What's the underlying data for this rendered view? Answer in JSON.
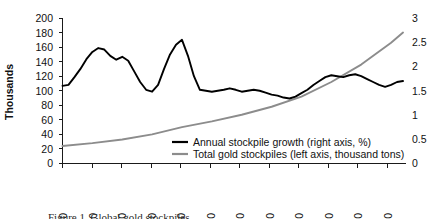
{
  "chart_data": {
    "type": "line",
    "title": "",
    "xlabel": "",
    "ylabel": "Thousands",
    "y2label": "",
    "xlim": [
      1900,
      2015
    ],
    "ylim": [
      0,
      200
    ],
    "y2lim": [
      0,
      3
    ],
    "grid": false,
    "legend_position": "inside-bottom-center",
    "xticks": [
      "1900",
      "1910",
      "1920",
      "1930",
      "1940",
      "1950",
      "1960",
      "1970",
      "1980",
      "1990",
      "2000",
      "2010"
    ],
    "yticks": [
      "0",
      "20",
      "40",
      "60",
      "80",
      "100",
      "120",
      "140",
      "160",
      "180",
      "200"
    ],
    "y2ticks": [
      "0",
      "0.5",
      "1",
      "1.5",
      "2",
      "2.5",
      "3"
    ],
    "series": [
      {
        "name": "Annual stockpile growth (right axis, %)",
        "axis": "right",
        "color": "#000000",
        "units": "%",
        "x": [
          1900,
          1902,
          1904,
          1906,
          1908,
          1910,
          1912,
          1914,
          1916,
          1918,
          1920,
          1922,
          1924,
          1926,
          1928,
          1930,
          1932,
          1934,
          1936,
          1938,
          1940,
          1942,
          1944,
          1946,
          1948,
          1950,
          1952,
          1954,
          1956,
          1958,
          1960,
          1962,
          1964,
          1966,
          1968,
          1970,
          1972,
          1974,
          1976,
          1978,
          1980,
          1982,
          1984,
          1986,
          1988,
          1990,
          1992,
          1994,
          1996,
          1998,
          2000,
          2002,
          2004,
          2006,
          2008,
          2010,
          2012,
          2014
        ],
        "values": [
          1.6,
          1.62,
          1.78,
          1.95,
          2.15,
          2.3,
          2.38,
          2.35,
          2.22,
          2.14,
          2.2,
          2.12,
          1.9,
          1.68,
          1.52,
          1.48,
          1.62,
          1.95,
          2.25,
          2.45,
          2.55,
          2.22,
          1.8,
          1.52,
          1.5,
          1.48,
          1.5,
          1.52,
          1.55,
          1.52,
          1.48,
          1.5,
          1.52,
          1.5,
          1.46,
          1.42,
          1.4,
          1.36,
          1.34,
          1.38,
          1.45,
          1.52,
          1.62,
          1.7,
          1.78,
          1.82,
          1.8,
          1.78,
          1.82,
          1.84,
          1.8,
          1.74,
          1.68,
          1.62,
          1.58,
          1.62,
          1.68,
          1.7
        ]
      },
      {
        "name": "Total gold stockpiles (left axis, thousand tons)",
        "axis": "left",
        "color": "#8c8c8c",
        "units": "thousand tons",
        "x": [
          1900,
          1910,
          1920,
          1930,
          1940,
          1950,
          1960,
          1970,
          1980,
          1990,
          2000,
          2010,
          2014
        ],
        "values": [
          24,
          28,
          33,
          40,
          50,
          58,
          67,
          78,
          92,
          112,
          136,
          166,
          180
        ]
      }
    ]
  },
  "legend": {
    "entries": [
      {
        "label": "Annual stockpile growth (right axis, %)",
        "color": "#000000",
        "name": "legend-annual-growth"
      },
      {
        "label": "Total gold stockpiles (left axis, thousand tons)",
        "color": "#8c8c8c",
        "name": "legend-total-stockpiles"
      }
    ]
  },
  "axes": {
    "y_title": "Thousands",
    "y_ticks": [
      "200",
      "180",
      "160",
      "140",
      "120",
      "100",
      "80",
      "60",
      "40",
      "20",
      "0"
    ],
    "y2_ticks": [
      "3",
      "2.5",
      "2",
      "1.5",
      "1",
      "0.5",
      "0"
    ],
    "x_ticks": [
      "1900",
      "1910",
      "1920",
      "1930",
      "1940",
      "1950",
      "1960",
      "1970",
      "1980",
      "1990",
      "2000",
      "2010"
    ]
  },
  "caption": {
    "text": "Figure 1. Global gold stockpiles"
  }
}
